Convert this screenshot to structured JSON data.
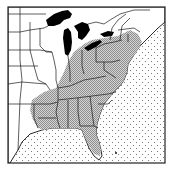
{
  "map": {
    "region": "Eastern United States",
    "description": "Distribution range map",
    "legend": [],
    "colors": {
      "background": "#ffffff",
      "land": "#ffffff",
      "range_fill": "#b8b8b8",
      "water_lakes": "#000000",
      "ocean_dots": "#666666",
      "borders": "#1a1a1a",
      "frame": "#222222"
    },
    "layers": [
      "frame",
      "ocean-stipple",
      "land",
      "range-shading",
      "great-lakes",
      "state-borders",
      "coastline"
    ]
  }
}
